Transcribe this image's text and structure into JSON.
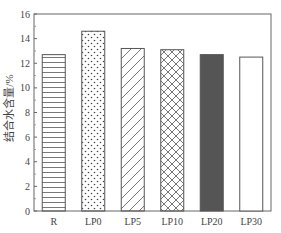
{
  "chart_data": {
    "type": "bar",
    "title": "",
    "xlabel": "",
    "ylabel": "结合水含量/%",
    "ylim": [
      0,
      16
    ],
    "yticks": [
      0,
      2,
      4,
      6,
      8,
      10,
      12,
      14,
      16
    ],
    "categories": [
      "R",
      "LP0",
      "LP5",
      "LP10",
      "LP20",
      "LP30"
    ],
    "values": [
      12.7,
      14.6,
      13.2,
      13.1,
      12.7,
      12.5
    ],
    "patterns": [
      "horizontal-lines",
      "dots",
      "diagonal-lines",
      "crosshatch",
      "solid-dark",
      "empty"
    ],
    "grid": false,
    "legend": null
  }
}
